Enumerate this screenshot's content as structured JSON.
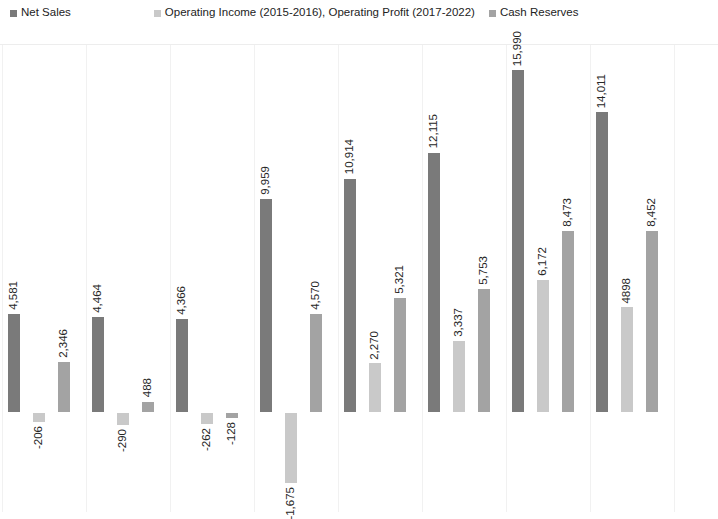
{
  "legend": {
    "entries": [
      {
        "label": "Net Sales",
        "color": "#7a7a7a",
        "icon": "square-swatch-icon"
      },
      {
        "label": "Operating Income (2015-2016), Operating Profit (2017-2022)",
        "color": "#c9c9c9",
        "icon": "square-swatch-icon"
      },
      {
        "label": "Cash Reserves",
        "color": "#a3a3a3",
        "icon": "square-swatch-icon"
      }
    ]
  },
  "chart_data": {
    "type": "bar",
    "title": "",
    "subtitle": "",
    "xlabel": "",
    "ylabel": "",
    "grid": true,
    "grid_axis": "x",
    "legend_position": "top",
    "orientation": "vertical",
    "grouping": "grouped",
    "data_labels": true,
    "data_label_rotation": 90,
    "axis_visible": false,
    "tick_labels_visible": false,
    "baseline_value": 0,
    "ylim": [
      -2400,
      17200
    ],
    "categories": [
      "1",
      "2",
      "3",
      "4",
      "5",
      "6",
      "7",
      "8"
    ],
    "category_labels_visible": false,
    "note": "Rightmost group is clipped by the image edge; its Cash Reserves bar and label are partially cut off.",
    "series": [
      {
        "name": "Net Sales",
        "color": "#7a7a7a",
        "values": [
          4581,
          4464,
          4366,
          9959,
          10914,
          12115,
          15990,
          14011
        ],
        "labels": [
          "4,581",
          "4,464",
          "4,366",
          "9,959",
          "10,914",
          "12,115",
          "15,990",
          "14,011"
        ]
      },
      {
        "name": "Operating Income (2015-2016), Operating Profit (2017-2022)",
        "color": "#c9c9c9",
        "values": [
          -206,
          -290,
          -262,
          -1675,
          2270,
          3337,
          6172,
          4898
        ],
        "labels": [
          "-206",
          "-290",
          "-262",
          "-1,675",
          "2,270",
          "3,337",
          "6,172",
          "4898"
        ]
      },
      {
        "name": "Cash Reserves",
        "color": "#a3a3a3",
        "values": [
          2346,
          488,
          -128,
          4570,
          5321,
          5753,
          8473,
          8452
        ],
        "labels": [
          "2,346",
          "488",
          "-128",
          "4,570",
          "5,321",
          "5,753",
          "8,473",
          "8,452"
        ]
      }
    ]
  }
}
